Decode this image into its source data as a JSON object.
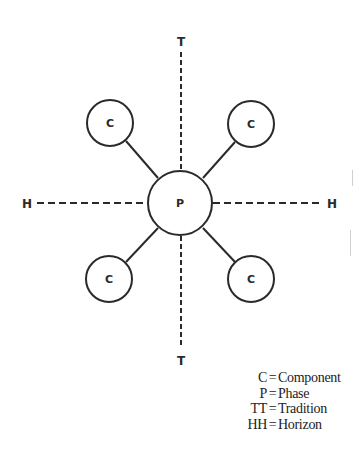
{
  "diagram": {
    "type": "concept-diagram",
    "center_node": {
      "label": "P",
      "cx": 180,
      "cy": 203,
      "r": 32
    },
    "component_nodes": [
      {
        "label": "C",
        "position": "top-left",
        "cx": 110,
        "cy": 123,
        "r": 23
      },
      {
        "label": "C",
        "position": "top-right",
        "cx": 251,
        "cy": 124,
        "r": 23
      },
      {
        "label": "C",
        "position": "bottom-left",
        "cx": 109,
        "cy": 279,
        "r": 23
      },
      {
        "label": "C",
        "position": "bottom-right",
        "cx": 251,
        "cy": 279,
        "r": 23
      }
    ],
    "axes": {
      "vertical": {
        "top_label": "T",
        "bottom_label": "T",
        "style": "dashed"
      },
      "horizontal": {
        "left_label": "H",
        "right_label": "H",
        "style": "dashed"
      }
    },
    "colors": {
      "stroke": "#2a2a2a",
      "background": "#ffffff"
    }
  },
  "legend": {
    "items": [
      {
        "key": "C",
        "eq": "=",
        "value": "Component"
      },
      {
        "key": "P",
        "eq": "=",
        "value": "Phase"
      },
      {
        "key": "TT",
        "eq": "=",
        "value": "Tradition"
      },
      {
        "key": "HH",
        "eq": "=",
        "value": "Horizon"
      }
    ]
  }
}
